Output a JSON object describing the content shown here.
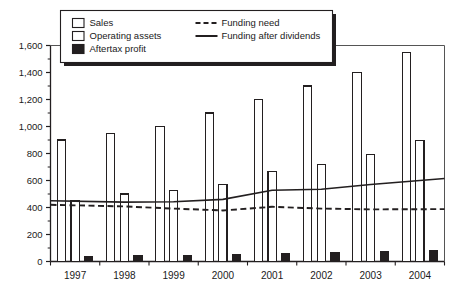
{
  "chart_data": {
    "type": "bar",
    "title": "",
    "subtitle": "",
    "xlabel": "",
    "ylabel": "",
    "categories": [
      "1997",
      "1998",
      "1999",
      "2000",
      "2001",
      "2002",
      "2003",
      "2004"
    ],
    "ylim": [
      0,
      1600
    ],
    "ytick_values": [
      0,
      200,
      400,
      600,
      800,
      1000,
      1200,
      1400,
      1600
    ],
    "ytick_labels": [
      "0",
      "200",
      "400",
      "600",
      "800",
      "1,000",
      "1,200",
      "1,400",
      "1,600"
    ],
    "grid": false,
    "legend_position": "top",
    "bar_series": [
      {
        "name": "Sales",
        "kind": "bar",
        "fill": "#ffffff",
        "stroke": "#231f20",
        "values": [
          900,
          950,
          1000,
          1100,
          1200,
          1300,
          1400,
          1550
        ]
      },
      {
        "name": "Operating assets",
        "kind": "bar",
        "fill": "#ffffff",
        "stroke": "#231f20",
        "values": [
          450,
          500,
          525,
          570,
          670,
          720,
          795,
          895
        ]
      },
      {
        "name": "Aftertax profit",
        "kind": "bar",
        "fill": "#231f20",
        "stroke": "#231f20",
        "values": [
          38,
          45,
          47,
          55,
          60,
          65,
          75,
          82
        ]
      }
    ],
    "line_series": [
      {
        "name": "Funding need",
        "kind": "line",
        "style": "dashed",
        "stroke": "#231f20",
        "values": [
          420,
          408,
          392,
          378,
          405,
          392,
          386,
          388
        ]
      },
      {
        "name": "Funding after dividends",
        "kind": "line",
        "style": "solid",
        "stroke": "#231f20",
        "values": [
          450,
          440,
          443,
          460,
          528,
          535,
          570,
          615
        ]
      }
    ]
  },
  "legend": {
    "items": [
      {
        "label": "Sales",
        "swatch": "open-square",
        "marker": "swatch"
      },
      {
        "label": "Operating assets",
        "swatch": "open-square",
        "marker": "swatch"
      },
      {
        "label": "Aftertax profit",
        "swatch": "filled-square",
        "marker": "swatch"
      },
      {
        "label": "Funding need",
        "swatch": "dashed-line",
        "marker": "line"
      },
      {
        "label": "Funding after dividends",
        "swatch": "solid-line",
        "marker": "line"
      }
    ]
  },
  "colors": {
    "ink": "#231f20",
    "paper": "#ffffff",
    "fill_dark": "#231f20",
    "fill_light": "#ffffff",
    "frame": "#555555"
  }
}
